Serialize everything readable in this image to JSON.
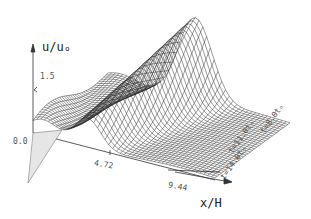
{
  "chart_data": {
    "type": "surface",
    "title": "",
    "zlabel": "u/uₒ",
    "xlabel": "x/H",
    "z_ticks": [
      "0.0",
      "1.5"
    ],
    "x_ticks": [
      "4.72",
      "9.44"
    ],
    "t_labels": [
      "t=8.0tₒ",
      "t=11.0tₒ",
      "t=14.0tₒ"
    ],
    "t_values": [
      8.0,
      11.0,
      14.0
    ],
    "x_range": [
      0,
      9.44
    ],
    "z_range": [
      0,
      1.5
    ],
    "peak": {
      "x": 4.0,
      "z": 1.9
    },
    "grid": false,
    "style": "monochrome wireframe mesh"
  },
  "axes": {
    "z_label": "u/uₒ",
    "z_tick_high": "1.5",
    "z_tick_zero": "0.0",
    "x_tick_1": "4.72",
    "x_tick_2": "9.44",
    "x_label": "x/H",
    "t8": "t=8.0tₒ",
    "t11": "t=11.0tₒ",
    "t14": "t=14.0tₒ"
  },
  "colors": {
    "line": "#222222",
    "background": "#ffffff"
  }
}
